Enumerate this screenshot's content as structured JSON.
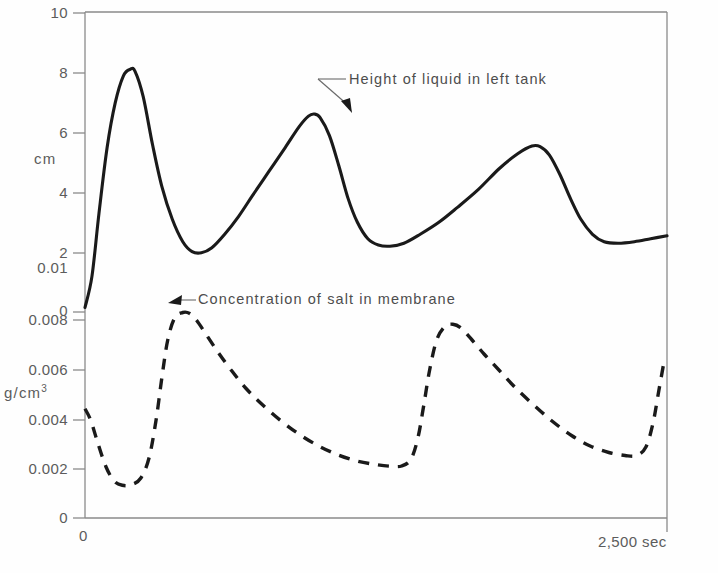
{
  "chart_data": {
    "type": "line",
    "title": "",
    "subtitle": "",
    "xlabel": "sec",
    "x_tick_labels": [
      "0",
      "2,500 sec"
    ],
    "x_axis_range": [
      0,
      2500
    ],
    "grid": false,
    "legend": "annotations-inline",
    "axes": [
      {
        "id": "upper",
        "ylabel": "cm",
        "ylim": [
          0,
          10
        ],
        "tick_labels": [
          "0",
          "2",
          "4",
          "6",
          "8",
          "10"
        ],
        "tick_values": [
          0,
          2,
          4,
          6,
          8,
          10
        ]
      },
      {
        "id": "lower",
        "ylabel": "g/cm3",
        "ylabel_base": "g/cm",
        "ylabel_exponent": "3",
        "ylim": [
          0,
          0.01
        ],
        "tick_labels": [
          "0",
          "0.002",
          "0.004",
          "0.006",
          "0.008",
          "0.01"
        ],
        "tick_values": [
          0,
          0.002,
          0.004,
          0.006,
          0.008,
          0.01
        ]
      }
    ],
    "series": [
      {
        "name": "Height of liquid in left tank",
        "axis": "upper",
        "units": "cm",
        "style": "solid",
        "color": "#1a1a1a",
        "points": [
          [
            0,
            0.15
          ],
          [
            30,
            1.2
          ],
          [
            60,
            3.3
          ],
          [
            95,
            5.5
          ],
          [
            130,
            7.0
          ],
          [
            165,
            7.9
          ],
          [
            195,
            8.12
          ],
          [
            215,
            8.05
          ],
          [
            250,
            7.2
          ],
          [
            290,
            5.6
          ],
          [
            330,
            4.2
          ],
          [
            375,
            3.1
          ],
          [
            420,
            2.35
          ],
          [
            460,
            2.02
          ],
          [
            500,
            1.98
          ],
          [
            545,
            2.15
          ],
          [
            600,
            2.6
          ],
          [
            660,
            3.2
          ],
          [
            720,
            3.9
          ],
          [
            790,
            4.7
          ],
          [
            860,
            5.5
          ],
          [
            920,
            6.2
          ],
          [
            960,
            6.55
          ],
          [
            985,
            6.62
          ],
          [
            1010,
            6.5
          ],
          [
            1050,
            5.9
          ],
          [
            1090,
            4.9
          ],
          [
            1130,
            3.8
          ],
          [
            1170,
            3.0
          ],
          [
            1215,
            2.45
          ],
          [
            1260,
            2.24
          ],
          [
            1310,
            2.2
          ],
          [
            1370,
            2.3
          ],
          [
            1440,
            2.6
          ],
          [
            1520,
            3.0
          ],
          [
            1600,
            3.5
          ],
          [
            1690,
            4.1
          ],
          [
            1780,
            4.8
          ],
          [
            1860,
            5.3
          ],
          [
            1920,
            5.55
          ],
          [
            1955,
            5.53
          ],
          [
            1995,
            5.25
          ],
          [
            2040,
            4.6
          ],
          [
            2085,
            3.8
          ],
          [
            2130,
            3.1
          ],
          [
            2180,
            2.6
          ],
          [
            2230,
            2.35
          ],
          [
            2290,
            2.3
          ],
          [
            2360,
            2.35
          ],
          [
            2430,
            2.45
          ],
          [
            2500,
            2.55
          ]
        ],
        "features": {
          "peaks": [
            {
              "x": 195,
              "y": 8.12
            },
            {
              "x": 985,
              "y": 6.62
            },
            {
              "x": 1920,
              "y": 5.55
            }
          ],
          "troughs": [
            {
              "x": 500,
              "y": 1.98
            },
            {
              "x": 1310,
              "y": 2.2
            },
            {
              "x": 2290,
              "y": 2.3
            }
          ],
          "start": {
            "x": 0,
            "y": 0.15
          },
          "end": {
            "x": 2500,
            "y": 2.55
          }
        }
      },
      {
        "name": "Concentration of salt in membrane",
        "axis": "lower",
        "units": "g/cm3",
        "style": "dashed",
        "color": "#1a1a1a",
        "points": [
          [
            0,
            0.00437
          ],
          [
            25,
            0.0039
          ],
          [
            55,
            0.003
          ],
          [
            90,
            0.00205
          ],
          [
            125,
            0.00148
          ],
          [
            160,
            0.00131
          ],
          [
            200,
            0.00133
          ],
          [
            240,
            0.0016
          ],
          [
            275,
            0.0024
          ],
          [
            305,
            0.0039
          ],
          [
            330,
            0.0056
          ],
          [
            355,
            0.0071
          ],
          [
            385,
            0.008
          ],
          [
            420,
            0.00822
          ],
          [
            450,
            0.00818
          ],
          [
            480,
            0.0079
          ],
          [
            520,
            0.00735
          ],
          [
            570,
            0.00665
          ],
          [
            625,
            0.00595
          ],
          [
            690,
            0.0052
          ],
          [
            760,
            0.00455
          ],
          [
            840,
            0.0039
          ],
          [
            920,
            0.00335
          ],
          [
            1000,
            0.0029
          ],
          [
            1080,
            0.00255
          ],
          [
            1160,
            0.0023
          ],
          [
            1240,
            0.00215
          ],
          [
            1310,
            0.00207
          ],
          [
            1360,
            0.00208
          ],
          [
            1400,
            0.00235
          ],
          [
            1430,
            0.0032
          ],
          [
            1455,
            0.0045
          ],
          [
            1480,
            0.0059
          ],
          [
            1510,
            0.0071
          ],
          [
            1545,
            0.00765
          ],
          [
            1580,
            0.00775
          ],
          [
            1615,
            0.0076
          ],
          [
            1660,
            0.00715
          ],
          [
            1715,
            0.00655
          ],
          [
            1780,
            0.0059
          ],
          [
            1850,
            0.0052
          ],
          [
            1930,
            0.0045
          ],
          [
            2010,
            0.00385
          ],
          [
            2090,
            0.0033
          ],
          [
            2170,
            0.00288
          ],
          [
            2250,
            0.00262
          ],
          [
            2320,
            0.0025
          ],
          [
            2370,
            0.0025
          ],
          [
            2410,
            0.00285
          ],
          [
            2440,
            0.0038
          ],
          [
            2465,
            0.0051
          ],
          [
            2490,
            0.0064
          ],
          [
            2520,
            0.0073
          ],
          [
            2555,
            0.00752
          ],
          [
            2590,
            0.00745
          ],
          [
            2640,
            0.007
          ],
          [
            2700,
            0.00635
          ],
          [
            2770,
            0.00565
          ],
          [
            2850,
            0.00495
          ]
        ],
        "features": {
          "peaks": [
            {
              "x": 420,
              "y": 0.00822
            },
            {
              "x": 1580,
              "y": 0.00775
            },
            {
              "x": 2555,
              "y": 0.00752
            }
          ],
          "troughs": [
            {
              "x": 160,
              "y": 0.00131
            },
            {
              "x": 1310,
              "y": 0.00207
            },
            {
              "x": 2340,
              "y": 0.0025
            }
          ],
          "start": {
            "x": 0,
            "y": 0.00437
          },
          "end": {
            "x": 2500,
            "y": 0.0049
          }
        }
      }
    ],
    "annotations": [
      {
        "id": "height-annotation",
        "text": "Height of liquid in left tank",
        "points_to_series": "Height of liquid in left tank"
      },
      {
        "id": "concentration-annotation",
        "text": "Concentration of salt in membrane",
        "points_to_series": "Concentration of salt in membrane"
      }
    ]
  },
  "axis_labels": {
    "upper_unit": "cm",
    "lower_unit_base": "g/cm",
    "lower_unit_exponent": "3",
    "upper_ticks": {
      "t10": "10",
      "t8": "8",
      "t6": "6",
      "t4": "4",
      "t2": "2",
      "t0": "0"
    },
    "lower_ticks": {
      "t001": "0.01",
      "t0008": "0.008",
      "t0006": "0.006",
      "t0004": "0.004",
      "t0002": "0.002",
      "t0": "0"
    },
    "x_ticks": {
      "origin": "0",
      "end": "2,500 sec"
    }
  },
  "colors": {
    "curve": "#1a1a1a",
    "axis": "#8a8a8a",
    "text": "#5c5c5c",
    "background": "#fefefe"
  }
}
